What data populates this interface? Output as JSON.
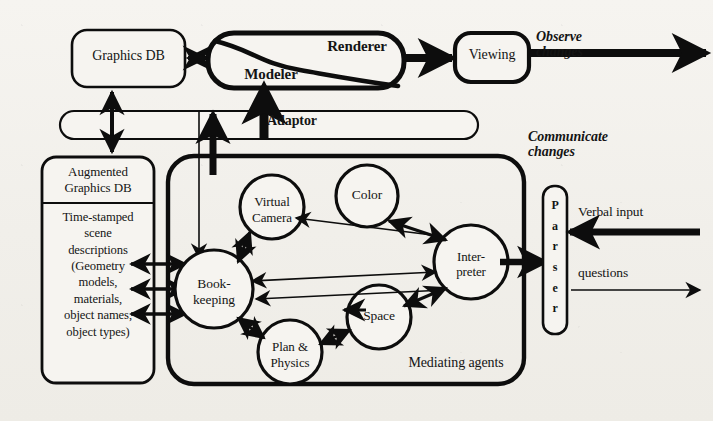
{
  "diagram": {
    "nodes": {
      "graphics_db": "Graphics DB",
      "modeler": "Modeler",
      "renderer": "Renderer",
      "viewing": "Viewing",
      "adaptor": "Adaptor",
      "augmented_db_header": "Augmented\nGraphics DB",
      "augmented_db_body": "Time-stamped\nscene\ndescriptions\n(Geometry\nmodels,\nmaterials,\nobject names,\nobject types)",
      "bookkeeping": "Book-\nkeeping",
      "virtual_camera": "Virtual\nCamera",
      "color": "Color",
      "space": "Space",
      "plan_physics": "Plan &\nPhysics",
      "interpreter": "Inter-\npreter",
      "parser": "P\na\nr\ns\ne\nr",
      "mediating_agents": "Mediating agents"
    },
    "annotations": {
      "observe_changes": "Observe\nchanges",
      "communicate_changes": "Communicate\nchanges",
      "verbal_input": "Verbal input",
      "questions": "questions"
    },
    "colors": {
      "ink": "#141414",
      "paper": "#f2f0eb",
      "stroke": "#000000"
    }
  }
}
